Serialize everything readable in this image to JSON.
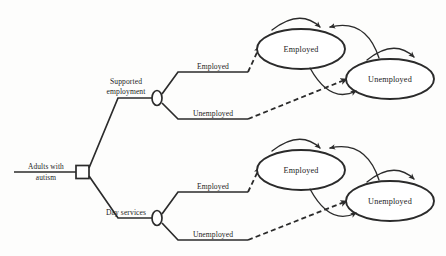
{
  "diagram": {
    "type": "decision-tree-markov-model",
    "root": {
      "label_line1": "Adults with",
      "label_line2": "autism",
      "node_type": "decision-square"
    },
    "strategies": [
      {
        "id": "supported-employment",
        "label_line1": "Supported",
        "label_line2": "employment",
        "node_type": "chance-circle",
        "branches": [
          {
            "id": "employed",
            "label": "Employed"
          },
          {
            "id": "unemployed",
            "label": "Unemployed"
          }
        ],
        "markov_states": [
          {
            "id": "employed",
            "label": "Employed"
          },
          {
            "id": "unemployed",
            "label": "Unemployed"
          }
        ]
      },
      {
        "id": "day-services",
        "label_line1": "Day services",
        "label_line2": "",
        "node_type": "chance-circle",
        "branches": [
          {
            "id": "employed",
            "label": "Employed"
          },
          {
            "id": "unemployed",
            "label": "Unemployed"
          }
        ],
        "markov_states": [
          {
            "id": "employed",
            "label": "Employed"
          },
          {
            "id": "unemployed",
            "label": "Unemployed"
          }
        ]
      }
    ],
    "colors": {
      "ink": "#2b2b2b",
      "background": "#fdfdfc",
      "node_fill": "#ffffff"
    }
  }
}
